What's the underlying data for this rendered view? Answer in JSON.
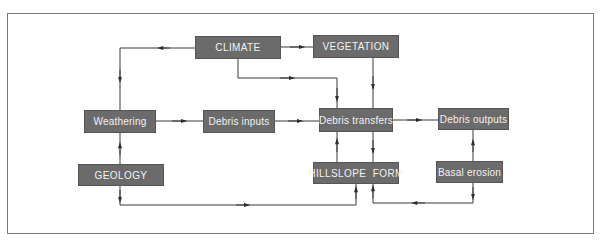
{
  "diagram": {
    "type": "flow",
    "colors": {
      "box_fill": "#6b6b6b",
      "box_text": "#f2f2f2",
      "line": "#3a3a3a",
      "frame": "#7a7a7a"
    },
    "nodes": {
      "climate": {
        "label": "CLIMATE"
      },
      "vegetation": {
        "label": "VEGETATION"
      },
      "weathering": {
        "label": "Weathering"
      },
      "debris_inputs": {
        "label": "Debris inputs"
      },
      "debris_transfers": {
        "label": "Debris transfers"
      },
      "debris_outputs": {
        "label": "Debris outputs"
      },
      "geology": {
        "label": "GEOLOGY"
      },
      "hillslope_form": {
        "label": "HILLSLOPE  FORM"
      },
      "basal_erosion": {
        "label": "Basal erosion"
      }
    },
    "edges": [
      {
        "from": "CLIMATE",
        "to": "Weathering"
      },
      {
        "from": "CLIMATE",
        "to": "VEGETATION"
      },
      {
        "from": "CLIMATE",
        "to": "Debris transfers"
      },
      {
        "from": "VEGETATION",
        "to": "Debris transfers"
      },
      {
        "from": "Weathering",
        "to": "Debris inputs"
      },
      {
        "from": "Debris inputs",
        "to": "Debris transfers"
      },
      {
        "from": "Debris transfers",
        "to": "Debris outputs"
      },
      {
        "from": "GEOLOGY",
        "to": "Weathering"
      },
      {
        "from": "GEOLOGY",
        "to": "HILLSLOPE FORM"
      },
      {
        "from": "HILLSLOPE FORM",
        "to": "Debris transfers"
      },
      {
        "from": "Debris transfers",
        "to": "HILLSLOPE FORM"
      },
      {
        "from": "Basal erosion",
        "to": "Debris outputs"
      },
      {
        "from": "Basal erosion",
        "to": "HILLSLOPE FORM"
      }
    ]
  }
}
